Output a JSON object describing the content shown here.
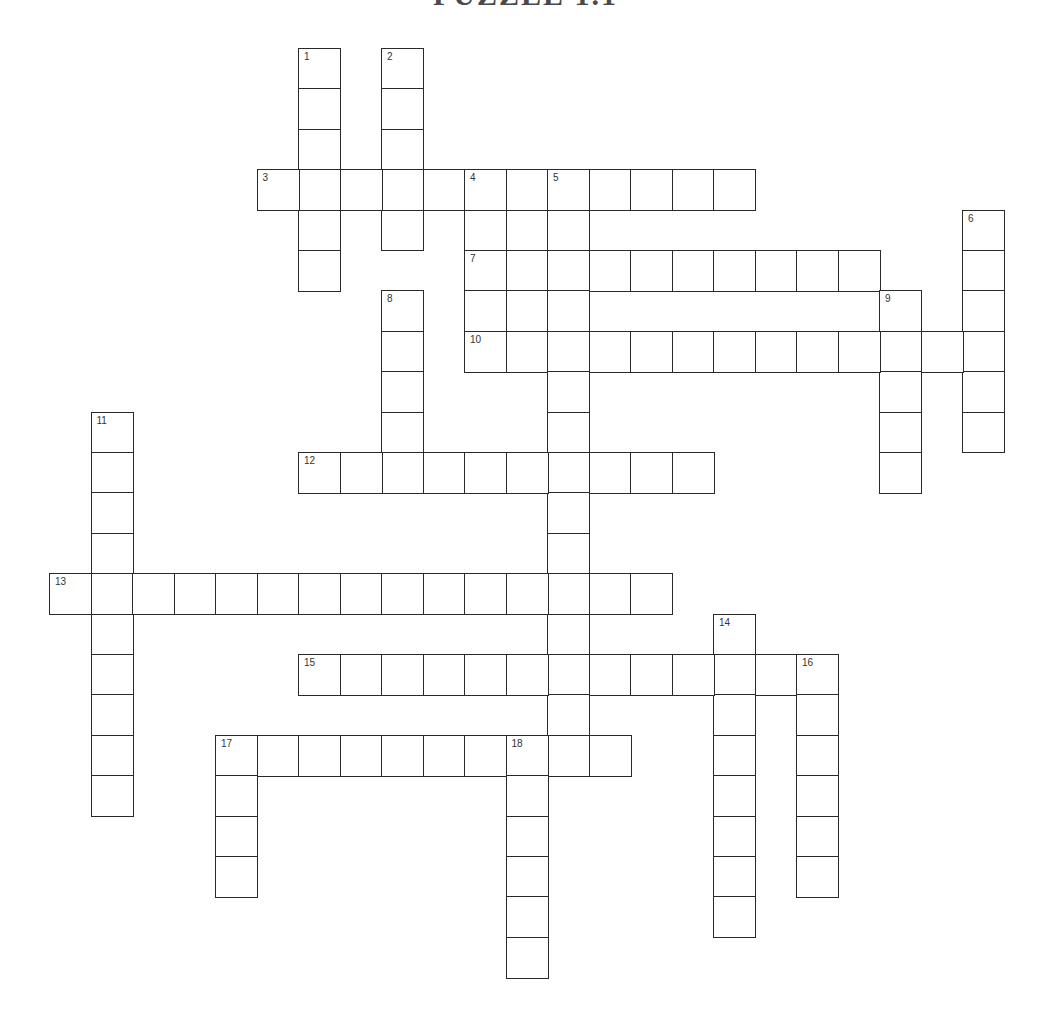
{
  "title": "PUZZLE 1.1",
  "grid": {
    "origin_x": 49,
    "origin_y": 48,
    "cell_w": 41.5,
    "cell_h": 40.4
  },
  "words": [
    {
      "number": "1",
      "direction": "down",
      "row": 0,
      "col": 6,
      "length": 6
    },
    {
      "number": "2",
      "direction": "down",
      "row": 0,
      "col": 8,
      "length": 5
    },
    {
      "number": "3",
      "direction": "across",
      "row": 3,
      "col": 5,
      "length": 12
    },
    {
      "number": "4",
      "direction": "down",
      "row": 3,
      "col": 10,
      "length": 5
    },
    {
      "number": "",
      "direction": "down",
      "row": 3,
      "col": 11,
      "length": 5
    },
    {
      "number": "5",
      "direction": "down",
      "row": 3,
      "col": 12,
      "length": 15
    },
    {
      "number": "6",
      "direction": "down",
      "row": 4,
      "col": 22,
      "length": 6
    },
    {
      "number": "7",
      "direction": "across",
      "row": 5,
      "col": 10,
      "length": 10
    },
    {
      "number": "8",
      "direction": "down",
      "row": 6,
      "col": 8,
      "length": 5
    },
    {
      "number": "9",
      "direction": "down",
      "row": 6,
      "col": 20,
      "length": 5
    },
    {
      "number": "10",
      "direction": "across",
      "row": 7,
      "col": 10,
      "length": 13
    },
    {
      "number": "11",
      "direction": "down",
      "row": 9,
      "col": 1,
      "length": 10
    },
    {
      "number": "12",
      "direction": "across",
      "row": 10,
      "col": 6,
      "length": 10
    },
    {
      "number": "13",
      "direction": "across",
      "row": 13,
      "col": 0,
      "length": 15
    },
    {
      "number": "14",
      "direction": "down",
      "row": 14,
      "col": 16,
      "length": 8
    },
    {
      "number": "15",
      "direction": "across",
      "row": 15,
      "col": 6,
      "length": 13
    },
    {
      "number": "16",
      "direction": "down",
      "row": 15,
      "col": 18,
      "length": 6
    },
    {
      "number": "17",
      "direction": "across",
      "row": 17,
      "col": 4,
      "length": 10
    },
    {
      "number": "17",
      "direction": "down",
      "row": 17,
      "col": 4,
      "length": 4
    },
    {
      "number": "18",
      "direction": "down",
      "row": 17,
      "col": 11,
      "length": 6
    }
  ]
}
